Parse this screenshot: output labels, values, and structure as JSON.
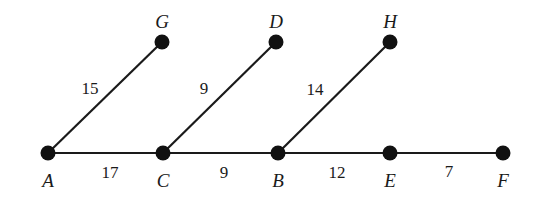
{
  "diagram": {
    "type": "weighted-graph",
    "nodes": [
      {
        "id": "A",
        "label": "A",
        "x": 48,
        "y": 153,
        "lx": 48,
        "ly": 187
      },
      {
        "id": "C",
        "label": "C",
        "x": 163,
        "y": 153,
        "lx": 163,
        "ly": 187
      },
      {
        "id": "B",
        "label": "B",
        "x": 278,
        "y": 153,
        "lx": 278,
        "ly": 187
      },
      {
        "id": "E",
        "label": "E",
        "x": 390,
        "y": 153,
        "lx": 390,
        "ly": 187
      },
      {
        "id": "F",
        "label": "F",
        "x": 503,
        "y": 153,
        "lx": 503,
        "ly": 187
      },
      {
        "id": "G",
        "label": "G",
        "x": 162,
        "y": 42,
        "lx": 162,
        "ly": 28
      },
      {
        "id": "D",
        "label": "D",
        "x": 276,
        "y": 42,
        "lx": 276,
        "ly": 28
      },
      {
        "id": "H",
        "label": "H",
        "x": 390,
        "y": 42,
        "lx": 390,
        "ly": 28
      }
    ],
    "edges": [
      {
        "from": "A",
        "to": "G",
        "weight": "15",
        "wx": 90,
        "wy": 94
      },
      {
        "from": "C",
        "to": "D",
        "weight": "9",
        "wx": 204,
        "wy": 94
      },
      {
        "from": "B",
        "to": "H",
        "weight": "14",
        "wx": 315,
        "wy": 95
      },
      {
        "from": "A",
        "to": "C",
        "weight": "17",
        "wx": 110,
        "wy": 178
      },
      {
        "from": "C",
        "to": "B",
        "weight": "9",
        "wx": 224,
        "wy": 178
      },
      {
        "from": "B",
        "to": "E",
        "weight": "12",
        "wx": 337,
        "wy": 178
      },
      {
        "from": "E",
        "to": "F",
        "weight": "7",
        "wx": 449,
        "wy": 177
      }
    ]
  }
}
